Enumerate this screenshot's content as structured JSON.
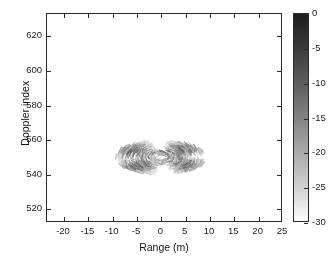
{
  "figure": {
    "background_color": "#ffffff",
    "axis_color": "#2b2b2b",
    "text_color": "#1a1a1a"
  },
  "axes": {
    "xlabel": "Range (m)",
    "ylabel": "Doppler index"
  },
  "colorbar": {
    "ticks": [
      "0",
      "-5",
      "-10",
      "-15",
      "-20",
      "-25",
      "-30"
    ],
    "tick_values": [
      0,
      -5,
      -10,
      -15,
      -20,
      -25,
      -30
    ],
    "top_color": "#1c1c1c",
    "bottom_color": "#fdfdfd",
    "colormap": "grayscale-inverted"
  },
  "chart_data": {
    "type": "heatmap",
    "title": "",
    "subtitle": "",
    "xlabel": "Range (m)",
    "ylabel": "Doppler index",
    "xlim": [
      -23.5,
      25
    ],
    "ylim": [
      512,
      633
    ],
    "xticks": [
      -20,
      -15,
      -10,
      -5,
      0,
      5,
      10,
      15,
      20,
      25
    ],
    "xtick_labels": [
      "-20",
      "-15",
      "-10",
      "-5",
      "0",
      "5",
      "10",
      "15",
      "20",
      "25"
    ],
    "yticks": [
      520,
      540,
      560,
      580,
      600,
      620
    ],
    "ytick_labels": [
      "520",
      "540",
      "560",
      "580",
      "600",
      "620"
    ],
    "grid": false,
    "legend": null,
    "colorbar": {
      "label": "",
      "range": [
        -30,
        0
      ],
      "ticks": [
        0,
        -5,
        -10,
        -15,
        -20,
        -25,
        -30
      ],
      "unit": "dB"
    },
    "pattern": {
      "kind": "four-lobe-pinwheel",
      "center_x": 0.0,
      "center_y": 550,
      "x_extent": [
        -14,
        14
      ],
      "y_extent": [
        515,
        582
      ],
      "lobes": [
        {
          "name": "upper-left",
          "angle_deg": 140,
          "arc_start_deg": 104,
          "arc_end_deg": 186,
          "radius_inner": 2.0,
          "radius_outer": 9.6,
          "peak_db": -9
        },
        {
          "name": "upper-right",
          "angle_deg": 40,
          "arc_start_deg": 14,
          "arc_end_deg": 82,
          "radius_inner": 2.0,
          "radius_outer": 9.4,
          "peak_db": -9
        },
        {
          "name": "lower-left",
          "angle_deg": 220,
          "arc_start_deg": 192,
          "arc_end_deg": 262,
          "radius_inner": 2.0,
          "radius_outer": 9.6,
          "peak_db": -9
        },
        {
          "name": "lower-right",
          "angle_deg": 320,
          "arc_start_deg": 286,
          "arc_end_deg": 352,
          "radius_inner": 2.0,
          "radius_outer": 9.4,
          "peak_db": -9
        }
      ],
      "dash_count_per_lobe": 210,
      "value_range_db": [
        -30,
        -4
      ]
    }
  }
}
